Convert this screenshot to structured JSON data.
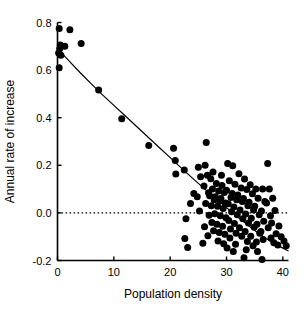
{
  "chart_data": {
    "type": "scatter",
    "title": "",
    "xlabel": "Population density",
    "ylabel": "Annual rate of increase",
    "xlim": [
      0,
      41
    ],
    "ylim": [
      -0.2,
      0.8
    ],
    "xticks": [
      0,
      10,
      20,
      30,
      40
    ],
    "xtick_labels": [
      "0",
      "10",
      "20",
      "30",
      "40"
    ],
    "yticks": [
      -0.2,
      0.0,
      0.2,
      0.4,
      0.6,
      0.8
    ],
    "ytick_labels": [
      "-0.2",
      "0.0",
      "0.2",
      "0.4",
      "0.6",
      "0.8"
    ],
    "grid": false,
    "legend": null,
    "marker": {
      "shape": "circle",
      "color": "#000000",
      "size_px": 7
    },
    "reference_lines": [
      {
        "name": "zero-line",
        "orientation": "horizontal",
        "y": 0.0,
        "style": "dotted",
        "color": "#000000"
      }
    ],
    "fit_curve": {
      "name": "fitted-trend",
      "style": "solid",
      "color": "#000000",
      "points": [
        [
          0.2,
          0.685
        ],
        [
          2.0,
          0.64
        ],
        [
          4.0,
          0.59
        ],
        [
          6.0,
          0.542
        ],
        [
          8.0,
          0.496
        ],
        [
          10.0,
          0.452
        ],
        [
          12.0,
          0.408
        ],
        [
          14.0,
          0.364
        ],
        [
          16.0,
          0.32
        ],
        [
          18.0,
          0.276
        ],
        [
          20.0,
          0.232
        ],
        [
          22.0,
          0.188
        ],
        [
          24.0,
          0.145
        ],
        [
          26.0,
          0.103
        ],
        [
          28.0,
          0.062
        ],
        [
          30.0,
          0.022
        ],
        [
          32.0,
          -0.017
        ],
        [
          34.0,
          -0.055
        ],
        [
          36.0,
          -0.092
        ],
        [
          38.0,
          -0.122
        ],
        [
          40.0,
          -0.148
        ],
        [
          41.0,
          -0.16
        ]
      ]
    },
    "points": [
      [
        0.3,
        0.775
      ],
      [
        2.2,
        0.77
      ],
      [
        4.2,
        0.712
      ],
      [
        0.5,
        0.705
      ],
      [
        1.3,
        0.7
      ],
      [
        0.4,
        0.69
      ],
      [
        0.2,
        0.672
      ],
      [
        0.6,
        0.662
      ],
      [
        0.3,
        0.61
      ],
      [
        7.3,
        0.516
      ],
      [
        11.4,
        0.396
      ],
      [
        16.2,
        0.283
      ],
      [
        20.9,
        0.22
      ],
      [
        20.6,
        0.272
      ],
      [
        21.0,
        0.163
      ],
      [
        22.5,
        0.18
      ],
      [
        22.8,
        -0.025
      ],
      [
        22.6,
        -0.108
      ],
      [
        23.1,
        -0.145
      ],
      [
        25.0,
        0.192
      ],
      [
        25.4,
        0.152
      ],
      [
        24.8,
        0.068
      ],
      [
        25.2,
        0.008
      ],
      [
        26.4,
        0.296
      ],
      [
        26.2,
        0.2
      ],
      [
        26.6,
        0.158
      ],
      [
        26.0,
        0.113
      ],
      [
        26.8,
        0.085
      ],
      [
        26.3,
        0.04
      ],
      [
        26.9,
        -0.01
      ],
      [
        26.1,
        -0.058
      ],
      [
        26.7,
        -0.096
      ],
      [
        27.2,
        0.143
      ],
      [
        27.5,
        0.1
      ],
      [
        27.0,
        0.072
      ],
      [
        27.8,
        0.055
      ],
      [
        27.3,
        0.03
      ],
      [
        27.9,
        -0.004
      ],
      [
        27.4,
        -0.04
      ],
      [
        27.7,
        -0.075
      ],
      [
        28.2,
        0.124
      ],
      [
        28.6,
        0.092
      ],
      [
        28.0,
        0.068
      ],
      [
        28.8,
        0.05
      ],
      [
        28.4,
        0.028
      ],
      [
        28.9,
        -0.012
      ],
      [
        28.3,
        -0.048
      ],
      [
        28.7,
        -0.082
      ],
      [
        28.5,
        -0.118
      ],
      [
        29.2,
        0.115
      ],
      [
        29.6,
        0.086
      ],
      [
        29.0,
        0.06
      ],
      [
        29.8,
        0.042
      ],
      [
        29.4,
        0.018
      ],
      [
        29.9,
        -0.02
      ],
      [
        29.3,
        -0.056
      ],
      [
        29.7,
        -0.09
      ],
      [
        29.5,
        -0.13
      ],
      [
        30.2,
        0.208
      ],
      [
        30.5,
        0.135
      ],
      [
        30.0,
        0.095
      ],
      [
        30.8,
        0.065
      ],
      [
        30.3,
        0.038
      ],
      [
        30.9,
        0.005
      ],
      [
        30.4,
        -0.032
      ],
      [
        30.7,
        -0.068
      ],
      [
        30.6,
        -0.105
      ],
      [
        31.1,
        0.198
      ],
      [
        31.5,
        0.12
      ],
      [
        31.0,
        0.082
      ],
      [
        31.8,
        0.055
      ],
      [
        31.3,
        0.025
      ],
      [
        31.9,
        -0.008
      ],
      [
        31.4,
        -0.045
      ],
      [
        31.7,
        -0.085
      ],
      [
        31.2,
        -0.162
      ],
      [
        32.2,
        0.165
      ],
      [
        32.6,
        0.105
      ],
      [
        32.0,
        0.075
      ],
      [
        32.8,
        0.048
      ],
      [
        32.4,
        0.012
      ],
      [
        32.9,
        -0.025
      ],
      [
        32.3,
        -0.062
      ],
      [
        32.7,
        -0.098
      ],
      [
        33.2,
        0.142
      ],
      [
        33.6,
        0.098
      ],
      [
        33.0,
        0.06
      ],
      [
        33.8,
        0.03
      ],
      [
        33.4,
        -0.005
      ],
      [
        33.9,
        -0.042
      ],
      [
        33.3,
        -0.078
      ],
      [
        33.7,
        -0.12
      ],
      [
        33.5,
        -0.155
      ],
      [
        34.2,
        0.118
      ],
      [
        34.6,
        0.08
      ],
      [
        34.0,
        0.045
      ],
      [
        34.8,
        0.012
      ],
      [
        34.4,
        -0.022
      ],
      [
        34.9,
        -0.06
      ],
      [
        34.3,
        -0.098
      ],
      [
        34.7,
        -0.138
      ],
      [
        35.2,
        0.1
      ],
      [
        35.6,
        0.062
      ],
      [
        35.0,
        0.028
      ],
      [
        35.8,
        -0.008
      ],
      [
        35.4,
        -0.048
      ],
      [
        35.9,
        -0.085
      ],
      [
        35.3,
        -0.122
      ],
      [
        36.4,
        0.1
      ],
      [
        36.8,
        0.048
      ],
      [
        36.2,
        0.008
      ],
      [
        36.6,
        -0.035
      ],
      [
        36.1,
        -0.078
      ],
      [
        36.5,
        -0.112
      ],
      [
        36.3,
        -0.196
      ],
      [
        37.3,
        0.208
      ],
      [
        37.6,
        0.1
      ],
      [
        37.1,
        0.042
      ],
      [
        37.8,
        -0.012
      ],
      [
        37.4,
        -0.062
      ],
      [
        37.9,
        -0.105
      ],
      [
        38.2,
        0.062
      ],
      [
        38.6,
        0.01
      ],
      [
        38.0,
        -0.042
      ],
      [
        38.8,
        -0.088
      ],
      [
        38.4,
        -0.125
      ],
      [
        39.3,
        -0.055
      ],
      [
        39.7,
        -0.1
      ],
      [
        39.1,
        -0.135
      ],
      [
        40.2,
        -0.118
      ],
      [
        40.6,
        -0.138
      ],
      [
        24.2,
        0.082
      ],
      [
        23.6,
        0.04
      ],
      [
        30.1,
        -0.148
      ],
      [
        31.6,
        -0.132
      ],
      [
        35.5,
        -0.162
      ],
      [
        33.1,
        -0.188
      ],
      [
        29.1,
        0.158
      ],
      [
        27.6,
        0.172
      ],
      [
        25.8,
        -0.128
      ]
    ]
  }
}
